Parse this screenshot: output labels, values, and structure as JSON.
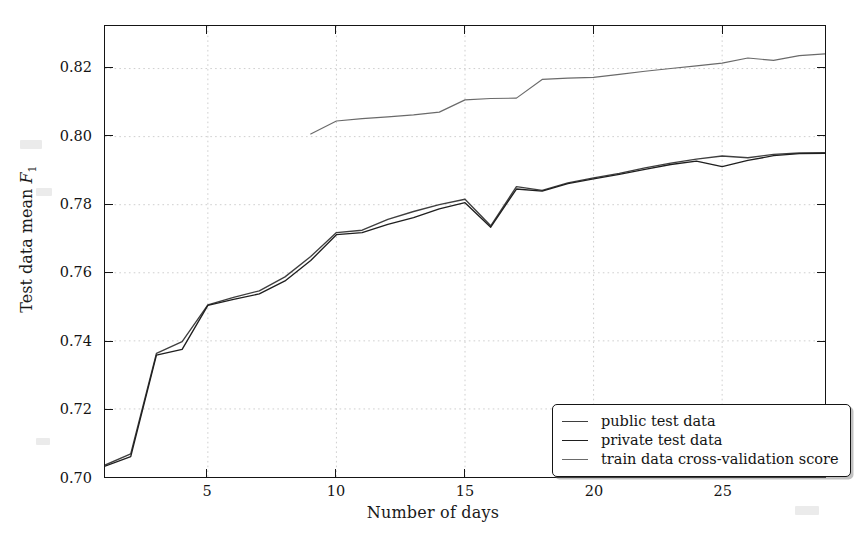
{
  "chart_data": {
    "type": "line",
    "title": "",
    "xlabel": "Number of days",
    "ylabel": "Test data mean F₁",
    "xlim": [
      1,
      29
    ],
    "ylim": [
      0.7,
      0.8325
    ],
    "grid": true,
    "legend_position": "lower right",
    "xticks": [
      5,
      10,
      15,
      20,
      25
    ],
    "xticklabels": [
      "5",
      "10",
      "15",
      "20",
      "25"
    ],
    "yticks": [
      0.7,
      0.72,
      0.74,
      0.76,
      0.78,
      0.8,
      0.82
    ],
    "yticklabels": [
      "0.70",
      "0.72",
      "0.74",
      "0.76",
      "0.78",
      "0.80",
      "0.82"
    ],
    "series": [
      {
        "name": "public test data",
        "color": "#3f3f3f",
        "x": [
          1,
          2,
          3,
          4,
          5,
          6,
          7,
          8,
          9,
          10,
          11,
          12,
          13,
          14,
          15,
          16,
          17,
          18,
          19,
          20,
          21,
          22,
          23,
          24,
          25,
          26,
          27,
          28,
          29
        ],
        "values": [
          0.7035,
          0.7068,
          0.7363,
          0.7398,
          0.7506,
          0.7528,
          0.7547,
          0.7588,
          0.7648,
          0.7718,
          0.7725,
          0.7757,
          0.778,
          0.78,
          0.7816,
          0.7738,
          0.7853,
          0.7842,
          0.7864,
          0.7879,
          0.7892,
          0.7908,
          0.7922,
          0.7934,
          0.7943,
          0.7938,
          0.7948,
          0.7952,
          0.7953
        ]
      },
      {
        "name": "private test data",
        "color": "#1f1f1f",
        "x": [
          1,
          2,
          3,
          4,
          5,
          6,
          7,
          8,
          9,
          10,
          11,
          12,
          13,
          14,
          15,
          16,
          17,
          18,
          19,
          20,
          21,
          22,
          23,
          24,
          25,
          26,
          27,
          28,
          29
        ],
        "values": [
          0.7032,
          0.706,
          0.7358,
          0.7375,
          0.7504,
          0.7522,
          0.7538,
          0.7576,
          0.7636,
          0.7712,
          0.7718,
          0.7742,
          0.7762,
          0.7788,
          0.7806,
          0.7734,
          0.7846,
          0.784,
          0.7862,
          0.7876,
          0.7889,
          0.7904,
          0.7918,
          0.7928,
          0.7912,
          0.793,
          0.7944,
          0.795,
          0.7951
        ]
      },
      {
        "name": "train data cross-validation score",
        "color": "#6a6a6a",
        "x": [
          9,
          10,
          11,
          12,
          13,
          14,
          15,
          16,
          17,
          18,
          19,
          20,
          21,
          22,
          23,
          24,
          25,
          26,
          27,
          28,
          29
        ],
        "values": [
          0.8008,
          0.8046,
          0.8053,
          0.8058,
          0.8064,
          0.8072,
          0.8108,
          0.8112,
          0.8113,
          0.8168,
          0.8172,
          0.8174,
          0.8183,
          0.8192,
          0.82,
          0.8208,
          0.8216,
          0.8231,
          0.8224,
          0.8238,
          0.8243
        ]
      }
    ]
  },
  "axes": {
    "xlabel": "Number of days",
    "ylabel_prefix": "Test data mean ",
    "ylabel_symbol": "F",
    "ylabel_subscript": "1"
  },
  "legend": {
    "entries": [
      {
        "label": "public test data",
        "color": "#3f3f3f"
      },
      {
        "label": "private test data",
        "color": "#1f1f1f"
      },
      {
        "label": "train data cross-validation score",
        "color": "#6a6a6a"
      }
    ]
  }
}
